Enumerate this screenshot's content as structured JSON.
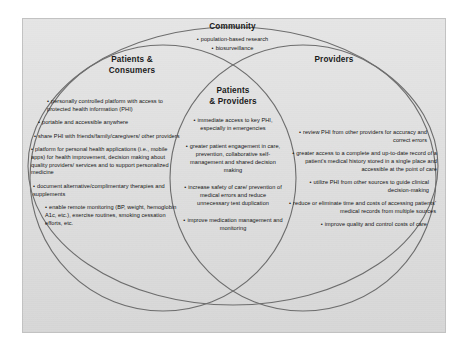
{
  "diagram": {
    "type": "venn",
    "colors": {
      "panel_background": "#d8d8d8",
      "outline": "#6d6d6d",
      "text": "#141414",
      "page_background": "#ffffff"
    },
    "regions": {
      "community": {
        "title": "Community",
        "bullets": [
          "population-based research",
          "biosurveillance"
        ]
      },
      "patients_consumers": {
        "title_line1": "Patients &",
        "title_line2": "Consumers",
        "bullets": [
          "personally controlled platform with access to protected health information (PHI)",
          "portable and accessible anywhere",
          "share PHI with friends/family/caregivers/ other providers",
          "platform for personal health applications (i.e., mobile apps) for health improvement, decision making about quality providers/ services and to support personalized medicine",
          "document alternative/complimentary therapies and supplements",
          "enable remote monitoring (BP, weight, hemoglobin A1c, etc.), exercise routines, smoking cessation efforts, etc."
        ]
      },
      "providers": {
        "title": "Providers",
        "bullets": [
          "review PHI from other providers for accuracy and correct errors",
          "greater access to a complete and up-to-date record of a patient's medical history stored in a single place and accessible at the point of care",
          "utilize PHI from other sources to guide clinical decision-making",
          "reduce or eliminate time and costs of accessing patients' medical records from multiple sources",
          "improve quality and control costs of care"
        ]
      },
      "patients_providers": {
        "title_line1": "Patients",
        "title_line2": "& Providers",
        "bullets": [
          "immediate access to key PHI, especially in emergencies",
          "greater patient engagement in care, prevention, collaborative self-management and shared decision making",
          "increase safety of care/ prevention of medical errors and reduce unnecessary test duplication",
          "improve medication management and monitoring"
        ]
      }
    }
  }
}
